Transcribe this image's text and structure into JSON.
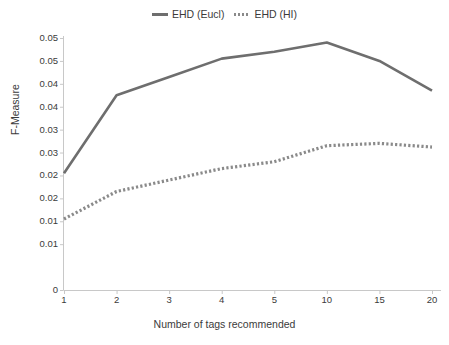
{
  "chart_data": {
    "type": "line",
    "title": "",
    "xlabel": "Number of tags recommended",
    "ylabel": "F-Measure",
    "categories": [
      "1",
      "2",
      "3",
      "4",
      "5",
      "10",
      "15",
      "20"
    ],
    "ytick_labels": [
      "0.05",
      "0.05",
      "0.04",
      "0.04",
      "0.03",
      "0.03",
      "0.02",
      "0.02",
      "0.01",
      "0.01",
      "0"
    ],
    "ytick_values": [
      0.055,
      0.05,
      0.045,
      0.04,
      0.035,
      0.03,
      0.025,
      0.02,
      0.015,
      0.01,
      0
    ],
    "ylim": [
      0,
      0.055
    ],
    "grid": false,
    "legend_position": "top-center",
    "series": [
      {
        "name": "EHD (Eucl)",
        "style": "solid",
        "color": "#6e6e6e",
        "values": [
          0.0255,
          0.0425,
          0.0465,
          0.0505,
          0.052,
          0.054,
          0.05,
          0.0435
        ]
      },
      {
        "name": "EHD (HI)",
        "style": "dotted",
        "color": "#8a8a8a",
        "values": [
          0.0155,
          0.0215,
          0.024,
          0.0265,
          0.028,
          0.0315,
          0.032,
          0.0312
        ]
      }
    ]
  }
}
